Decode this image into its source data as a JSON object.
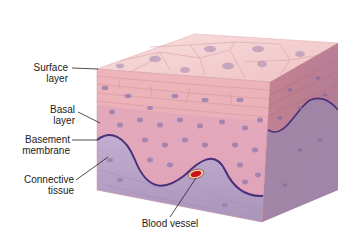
{
  "diagram": {
    "labels": [
      {
        "id": "surface",
        "line1": "Surface",
        "line2": "layer"
      },
      {
        "id": "basal",
        "line1": "Basal",
        "line2": "layer"
      },
      {
        "id": "basement",
        "line1": "Basement",
        "line2": "membrane"
      },
      {
        "id": "connective",
        "line1": "Connective",
        "line2": "tissue"
      },
      {
        "id": "vessel",
        "line1": "Blood vessel"
      }
    ],
    "colors": {
      "surface": "#f2c9c9",
      "epithelium": "#e8a8b0",
      "basal_cells": "#dca0b8",
      "membrane": "#4a2f7a",
      "connective": "#b9a3c6",
      "blood": "#c8141e",
      "nucleus": "#9b7fae"
    }
  }
}
